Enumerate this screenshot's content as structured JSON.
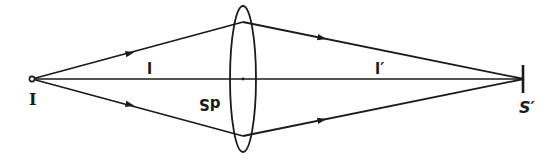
{
  "diagram": {
    "type": "optics-ray-diagram",
    "labels": {
      "source": "I",
      "object_distance": "l",
      "image_distance": "l′",
      "lens_area_element": "dS",
      "image_point": "S′"
    },
    "colors": {
      "stroke": "#1a1a1a",
      "background": "#ffffff"
    },
    "geometry": {
      "axis_y": 79,
      "source_x": 32,
      "image_x": 524,
      "lens": {
        "cx": 243,
        "cy": 79,
        "rx": 13,
        "ry": 73
      },
      "upper_ray_lens_y": 22,
      "lower_ray_lens_y": 136
    }
  }
}
